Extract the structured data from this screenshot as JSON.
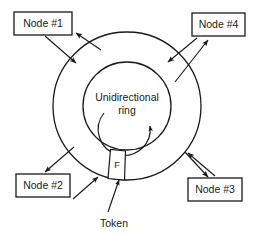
{
  "diagram": {
    "center_label_line1": "Unidirectional",
    "center_label_line2": "ring",
    "token_letter": "F",
    "token_caption": "Token",
    "stroke_color": "#1a1a1a",
    "background_color": "#ffffff",
    "nodes": [
      {
        "id": "node-1",
        "label": "Node #1",
        "position": "top-left"
      },
      {
        "id": "node-2",
        "label": "Node #2",
        "position": "bottom-left"
      },
      {
        "id": "node-3",
        "label": "Node #3",
        "position": "bottom-right"
      },
      {
        "id": "node-4",
        "label": "Node #4",
        "position": "top-right"
      }
    ],
    "ring": {
      "outer_radius": 74,
      "inner_radius": 44,
      "center_x": 127,
      "center_y": 106,
      "direction": "clockwise"
    }
  }
}
